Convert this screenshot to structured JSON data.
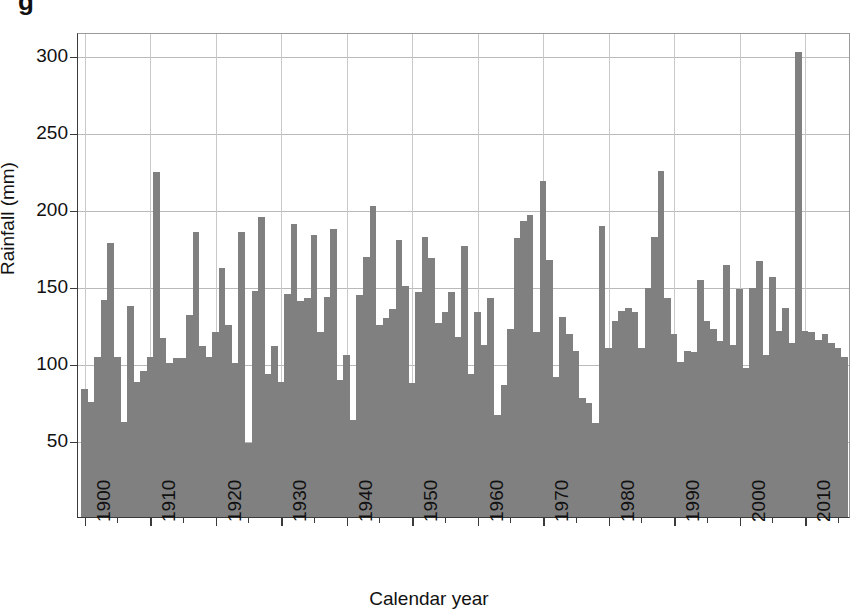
{
  "figure": {
    "caption_fragment": "g",
    "bar_color": "#808080",
    "axis_color": "#3a3a3a",
    "grid_color": "#b9b9b9"
  },
  "chart_data": {
    "type": "bar",
    "title": "",
    "xlabel": "Calendar year",
    "ylabel": "Rainfall (mm)",
    "xlim": [
      1899,
      2017
    ],
    "ylim": [
      0,
      315
    ],
    "ytick_values": [
      50,
      100,
      150,
      200,
      250,
      300
    ],
    "ytick_labels": [
      "50",
      "100",
      "150",
      "200",
      "250",
      "300"
    ],
    "xtick_values": [
      1900,
      1910,
      1920,
      1930,
      1940,
      1950,
      1960,
      1970,
      1980,
      1990,
      2000,
      2010
    ],
    "xtick_labels": [
      "1900",
      "1910",
      "1920",
      "1930",
      "1940",
      "1950",
      "1960",
      "1970",
      "1980",
      "1990",
      "2000",
      "2010"
    ],
    "xtick_minor_values": [
      1905,
      1915,
      1925,
      1935,
      1945,
      1955,
      1965,
      1975,
      1985,
      1995,
      2005,
      2015
    ],
    "grid": "horizontal-and-vertical",
    "legend": "none",
    "categories": [
      1900,
      1901,
      1902,
      1903,
      1904,
      1905,
      1906,
      1907,
      1908,
      1909,
      1910,
      1911,
      1912,
      1913,
      1914,
      1915,
      1916,
      1917,
      1918,
      1919,
      1920,
      1921,
      1922,
      1923,
      1924,
      1925,
      1926,
      1927,
      1928,
      1929,
      1930,
      1931,
      1932,
      1933,
      1934,
      1935,
      1936,
      1937,
      1938,
      1939,
      1940,
      1941,
      1942,
      1943,
      1944,
      1945,
      1946,
      1947,
      1948,
      1949,
      1950,
      1951,
      1952,
      1953,
      1954,
      1955,
      1956,
      1957,
      1958,
      1959,
      1960,
      1961,
      1962,
      1963,
      1964,
      1965,
      1966,
      1967,
      1968,
      1969,
      1970,
      1971,
      1972,
      1973,
      1974,
      1975,
      1976,
      1977,
      1978,
      1979,
      1980,
      1981,
      1982,
      1983,
      1984,
      1985,
      1986,
      1987,
      1988,
      1989,
      1990,
      1991,
      1992,
      1993,
      1994,
      1995,
      1996,
      1997,
      1998,
      1999,
      2000,
      2001,
      2002,
      2003,
      2004,
      2005,
      2006,
      2007,
      2008,
      2009,
      2010,
      2011,
      2012,
      2013,
      2014,
      2015,
      2016
    ],
    "values": [
      83,
      75,
      104,
      141,
      178,
      104,
      62,
      137,
      88,
      95,
      104,
      224,
      116,
      100,
      103,
      103,
      131,
      185,
      111,
      104,
      120,
      162,
      125,
      100,
      185,
      48,
      147,
      195,
      93,
      111,
      88,
      145,
      190,
      140,
      142,
      183,
      120,
      143,
      187,
      89,
      105,
      63,
      144,
      169,
      202,
      125,
      129,
      135,
      180,
      150,
      87,
      146,
      182,
      168,
      126,
      133,
      146,
      117,
      176,
      93,
      133,
      112,
      142,
      66,
      86,
      122,
      181,
      192,
      196,
      120,
      218,
      167,
      91,
      130,
      119,
      108,
      77,
      74,
      61,
      189,
      110,
      127,
      134,
      136,
      133,
      110,
      149,
      182,
      225,
      142,
      119,
      101,
      108,
      107,
      154,
      127,
      122,
      114,
      164,
      112,
      148,
      97,
      149,
      166,
      105,
      156,
      121,
      136,
      113,
      302,
      121,
      120,
      115,
      119,
      113,
      110,
      104
    ],
    "units": "mm",
    "series_name": "Annual rainfall"
  }
}
